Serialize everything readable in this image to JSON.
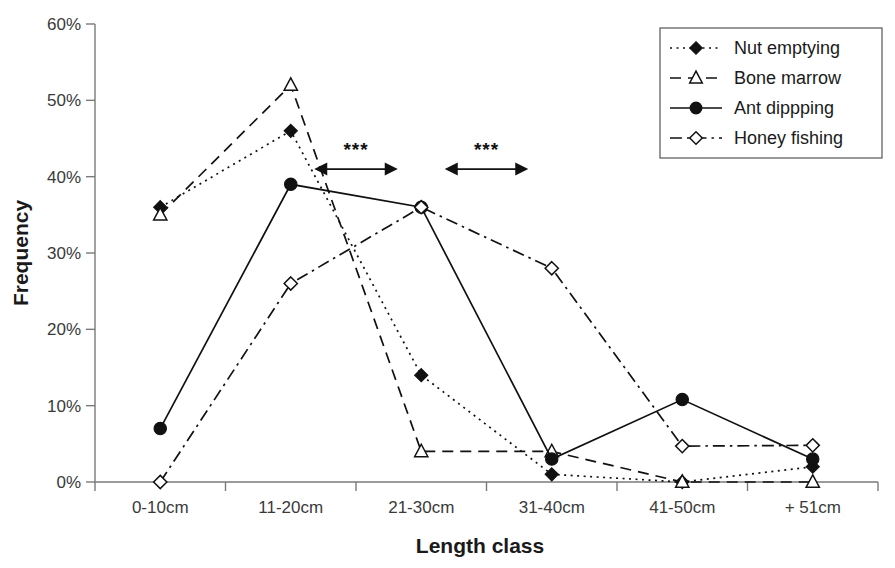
{
  "chart_data": {
    "type": "line",
    "title": "",
    "xlabel": "Length class",
    "ylabel": "Frequency",
    "categories": [
      "0-10cm",
      "11-20cm",
      "21-30cm",
      "31-40cm",
      "41-50cm",
      "+ 51cm"
    ],
    "ylim": [
      0,
      60
    ],
    "y_ticks": [
      0,
      10,
      20,
      30,
      40,
      50,
      60
    ],
    "y_tick_labels": [
      "0%",
      "10%",
      "20%",
      "30%",
      "40%",
      "50%",
      "60%"
    ],
    "grid": false,
    "legend_position": "top-right",
    "series": [
      {
        "name": "Nut emptying",
        "marker": "filled-diamond",
        "line_style": "dotted",
        "values": [
          36,
          46,
          14,
          1,
          0,
          2
        ]
      },
      {
        "name": "Bone marrow",
        "marker": "open-triangle",
        "line_style": "dashed",
        "values": [
          35,
          52,
          4,
          4,
          0,
          0
        ]
      },
      {
        "name": "Ant dippping",
        "marker": "filled-circle",
        "line_style": "solid",
        "values": [
          7,
          39,
          36,
          3,
          10.8,
          3
        ]
      },
      {
        "name": "Honey fishing",
        "marker": "open-diamond",
        "line_style": "dash-dot",
        "values": [
          0,
          26,
          36,
          28,
          4.7,
          4.8
        ]
      }
    ],
    "annotations": [
      {
        "label": "***",
        "type": "double-headed-arrow",
        "span_categories": [
          "11-20cm",
          "21-30cm"
        ],
        "y_value": 41
      },
      {
        "label": "***",
        "type": "double-headed-arrow",
        "span_categories": [
          "21-30cm",
          "31-40cm"
        ],
        "y_value": 41
      }
    ]
  },
  "colors": {
    "ink": "#111111",
    "axis": "#7a7a7a",
    "tick_text": "#3a3a3a",
    "background": "#ffffff"
  }
}
